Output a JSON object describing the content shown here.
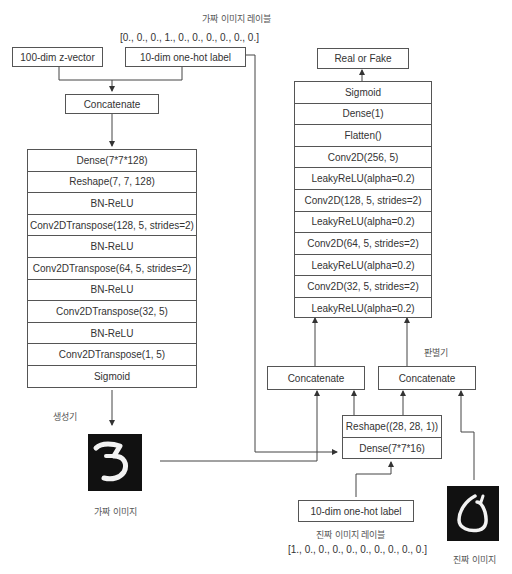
{
  "generator": {
    "title": "생성기",
    "fake_label_caption": "가짜 이미지 레이블",
    "fake_label_vector": "[0., 0., 0., 1., 0., 0., 0., 0., 0., 0.]",
    "z_input": "100-dim z-vector",
    "label_input": "10-dim one-hot label",
    "concat": "Concatenate",
    "layers": [
      "Dense(7*7*128)",
      "Reshape(7, 7, 128)",
      "BN-ReLU",
      "Conv2DTranspose(128, 5, strides=2)",
      "BN-ReLU",
      "Conv2DTranspose(64, 5, strides=2)",
      "BN-ReLU",
      "Conv2DTranspose(32, 5)",
      "BN-ReLU",
      "Conv2DTranspose(1, 5)",
      "Sigmoid"
    ],
    "output_caption": "가짜 이미지",
    "output_digit": "3"
  },
  "discriminator": {
    "title": "판별기",
    "output": "Real or Fake",
    "layers": [
      "Sigmoid",
      "Dense(1)",
      "Flatten()",
      "Conv2D(256, 5)",
      "LeakyReLU(alpha=0.2)",
      "Conv2D(128, 5, strides=2)",
      "LeakyReLU(alpha=0.2)",
      "Conv2D(64, 5, strides=2)",
      "LeakyReLU(alpha=0.2)",
      "Conv2D(32, 5, strides=2)",
      "LeakyReLU(alpha=0.2)"
    ],
    "concat_left": "Concatenate",
    "concat_right": "Concatenate",
    "label_branch": [
      "Reshape((28, 28, 1))",
      "Dense(7*7*16)"
    ],
    "real_label_input": "10-dim one-hot label",
    "real_label_caption": "진짜 이미지 레이블",
    "real_label_vector": "[1., 0., 0., 0., 0., 0., 0., 0., 0., 0.]",
    "real_image_caption": "진짜 이미지",
    "real_image_digit": "6"
  }
}
